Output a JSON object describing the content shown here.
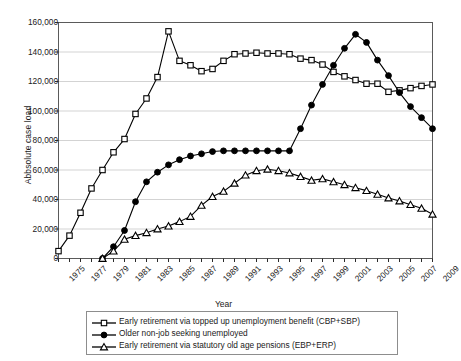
{
  "chart_data": {
    "type": "line",
    "title": "",
    "xlabel": "Year",
    "ylabel": "Abbsolute case load",
    "xlim": [
      1975,
      2009
    ],
    "ylim": [
      0,
      160000
    ],
    "ytick_step": 20000,
    "xtick_step": 2,
    "grid": "horizontal",
    "legend_position": "below-plot",
    "ytick_labels": [
      "0",
      "20,000",
      "40,000",
      "60,000",
      "80,000",
      "100,000",
      "120,000",
      "140,000",
      "160,000"
    ],
    "ytick_values": [
      0,
      20000,
      40000,
      60000,
      80000,
      100000,
      120000,
      140000,
      160000
    ],
    "xtick_labels": [
      "1975",
      "1977",
      "1979",
      "1981",
      "1983",
      "1985",
      "1987",
      "1989",
      "1991",
      "1993",
      "1995",
      "1997",
      "1999",
      "2001",
      "2003",
      "2005",
      "2007",
      "2009"
    ],
    "x": [
      1975,
      1976,
      1977,
      1978,
      1979,
      1980,
      1981,
      1982,
      1983,
      1984,
      1985,
      1986,
      1987,
      1988,
      1989,
      1990,
      1991,
      1992,
      1993,
      1994,
      1995,
      1996,
      1997,
      1998,
      1999,
      2000,
      2001,
      2002,
      2003,
      2004,
      2005,
      2006,
      2007,
      2008,
      2009
    ],
    "series": [
      {
        "name": "Early retirement via topped up unemployment benefit (CBP+SBP)",
        "marker": "open-square",
        "color": "#000000",
        "values": [
          5000,
          15500,
          31000,
          47500,
          60000,
          72000,
          81000,
          98000,
          108500,
          123000,
          154000,
          134000,
          131000,
          127000,
          128500,
          134000,
          138500,
          139000,
          139500,
          139000,
          139000,
          138500,
          135500,
          134500,
          131500,
          126500,
          123500,
          121000,
          118500,
          118500,
          113000,
          114000,
          115500,
          117000,
          118000
        ]
      },
      {
        "name": "Older non-job seeking unemployed",
        "marker": "filled-circle",
        "color": "#000000",
        "values": [
          0,
          0,
          0,
          0,
          0,
          8000,
          19000,
          38500,
          52000,
          58500,
          63500,
          67000,
          69500,
          71000,
          72500,
          73000,
          73000,
          73000,
          73000,
          73000,
          73000,
          73000,
          88000,
          104000,
          118000,
          131000,
          142500,
          152000,
          146500,
          134500,
          124000,
          112500,
          103000,
          95500,
          88000
        ]
      },
      {
        "name": "Early retirement via statutory old age pensions (EBP+ERP)",
        "marker": "open-triangle",
        "color": "#000000",
        "values": [
          0,
          0,
          0,
          0,
          0,
          5000,
          13000,
          15500,
          17500,
          20000,
          22000,
          25000,
          28500,
          36000,
          42000,
          45500,
          51000,
          56500,
          59500,
          60500,
          59500,
          58000,
          55500,
          53000,
          54000,
          52000,
          50000,
          48000,
          46000,
          43500,
          41000,
          39000,
          36500,
          34000,
          30000
        ]
      }
    ]
  }
}
